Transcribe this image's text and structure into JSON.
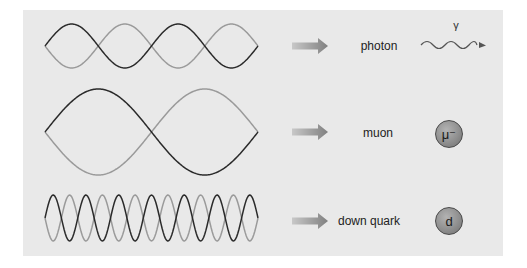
{
  "rows": [
    {
      "id": "photon",
      "label": "photon",
      "symbol": "γ",
      "icon": "wavy-arrow-icon",
      "wave": {
        "half_periods": 4,
        "x_start": 45,
        "x_end": 258,
        "center_y": 46,
        "amplitude": 22
      }
    },
    {
      "id": "muon",
      "label": "muon",
      "symbol": "μ⁻",
      "icon": "particle-sphere-icon",
      "wave": {
        "half_periods": 2,
        "x_start": 45,
        "x_end": 258,
        "center_y": 132,
        "amplitude": 43
      }
    },
    {
      "id": "down-quark",
      "label": "down quark",
      "symbol": "d",
      "icon": "particle-sphere-icon",
      "wave": {
        "half_periods": 13,
        "x_start": 45,
        "x_end": 258,
        "center_y": 218,
        "amplitude": 23
      }
    }
  ],
  "colors": {
    "panel": "#e9e9e9",
    "wave_dark": "#2a2a2a",
    "wave_light": "#9a9a9a",
    "arrow": "#8a8a8a",
    "sphere": "#9a9a9a"
  }
}
